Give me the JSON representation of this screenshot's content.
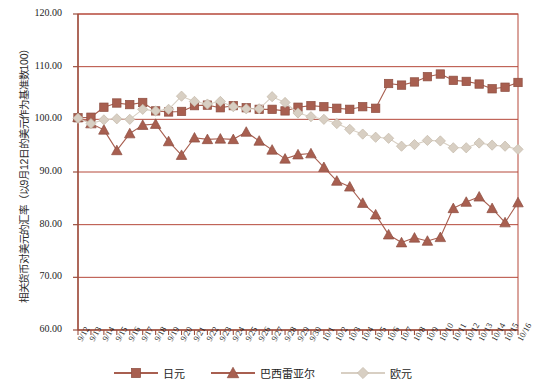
{
  "chart_data": {
    "type": "line",
    "title": "",
    "xlabel": "",
    "ylabel": "相关货币对美元的汇率（以9月12日的美元作为基准数100）",
    "ylim": [
      60,
      120
    ],
    "ytick_labels": [
      "120.00",
      "110.00",
      "100.00",
      "90.00",
      "80.00",
      "70.00",
      "60.00"
    ],
    "yticks": [
      120,
      110,
      100,
      90,
      80,
      70,
      60
    ],
    "grid": true,
    "legend_position": "bottom",
    "categories": [
      "9/12",
      "9/13",
      "9/14",
      "9/15",
      "9/16",
      "9/17",
      "9/18",
      "9/19",
      "9/20",
      "9/21",
      "9/22",
      "9/23",
      "9/24",
      "9/25",
      "9/26",
      "9/27",
      "9/28",
      "9/29",
      "9/30",
      "10/1",
      "10/2",
      "10/3",
      "10/4",
      "10/5",
      "10/6",
      "10/7",
      "10/8",
      "10/9",
      "10/10",
      "10/11",
      "10/12",
      "10/13",
      "10/14",
      "10/15",
      "10/16"
    ],
    "series": [
      {
        "name": "日元",
        "marker": "square",
        "color": "#a85f50",
        "values": [
          100.3,
          100.4,
          102.3,
          103.1,
          102.8,
          103.2,
          101.6,
          101.4,
          101.5,
          102.6,
          102.7,
          102.2,
          102.6,
          102.2,
          101.9,
          101.9,
          101.6,
          102.3,
          102.6,
          102.4,
          102.1,
          101.9,
          102.4,
          102.1,
          106.8,
          106.5,
          107.1,
          108.1,
          108.6,
          107.4,
          107.2,
          106.7,
          105.8,
          106.1,
          107.0
        ]
      },
      {
        "name": "巴西雷亚尔",
        "marker": "triangle",
        "color": "#a85f50",
        "values": [
          100.4,
          99.2,
          98.0,
          94.1,
          97.3,
          98.9,
          99.1,
          95.8,
          93.2,
          96.5,
          96.2,
          96.3,
          96.2,
          97.6,
          95.9,
          94.2,
          92.5,
          93.3,
          93.5,
          90.9,
          88.3,
          87.2,
          84.1,
          81.9,
          78.1,
          76.6,
          77.5,
          76.9,
          77.6,
          83.1,
          84.3,
          85.3,
          83.1,
          80.4,
          84.2
        ]
      },
      {
        "name": "欧元",
        "marker": "diamond",
        "color": "#d8cfc3",
        "values": [
          100.2,
          99.2,
          99.9,
          100.1,
          100.0,
          101.9,
          101.6,
          101.9,
          104.4,
          103.4,
          102.9,
          103.4,
          102.4,
          102.0,
          102.0,
          104.3,
          103.2,
          101.2,
          100.5,
          100.0,
          99.2,
          98.1,
          97.2,
          96.6,
          96.4,
          94.9,
          95.2,
          96.0,
          95.9,
          94.6,
          94.6,
          95.5,
          95.1,
          94.9,
          94.3
        ]
      }
    ]
  },
  "legend": {
    "items": [
      {
        "label": "日元",
        "marker": "square-marker-icon"
      },
      {
        "label": "巴西雷亚尔",
        "marker": "triangle-marker-icon"
      },
      {
        "label": "欧元",
        "marker": "diamond-marker-icon"
      }
    ]
  },
  "colors": {
    "line_brick": "#a85f50",
    "line_beige": "#d8cfc3",
    "axis": "#9b4f3f",
    "grid": "#b5483a",
    "plot_background": "#ffffff"
  }
}
